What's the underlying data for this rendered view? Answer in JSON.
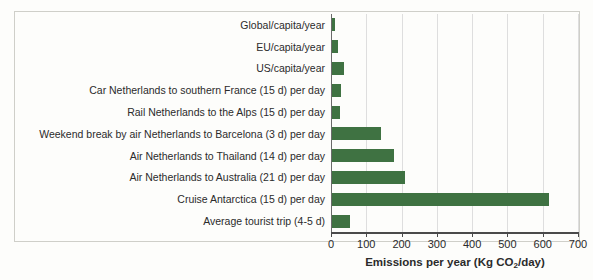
{
  "chart_data": {
    "type": "bar",
    "orientation": "horizontal",
    "title": "",
    "xlabel": "Emissions per year (Kg CO2/day)",
    "xlabel_prefix": "Emissions per year (Kg CO",
    "xlabel_subscript": "2",
    "xlabel_suffix": "/day)",
    "ylabel": "",
    "xlim": [
      0,
      700
    ],
    "xticks": [
      0,
      100,
      200,
      300,
      400,
      500,
      600,
      700
    ],
    "xticklabels": [
      "0",
      "100",
      "200",
      "300",
      "400",
      "500",
      "600",
      "700"
    ],
    "grid": "vertical",
    "legend": "none",
    "bar_color": "#3f7242",
    "categories": [
      "Global/capita/year",
      "EU/capita/year",
      "US/capita/year",
      "Car Netherlands to southern France (15 d) per day",
      "Rail Netherlands to the Alps (15 d) per day",
      "Weekend break by air Netherlands to Barcelona (3 d) per day",
      "Air Netherlands to Thailand (14 d) per day",
      "Air Netherlands to Australia (21 d) per day",
      "Cruise Antarctica (15 d) per day",
      "Average tourist trip (4-5 d)"
    ],
    "values": [
      8,
      17,
      34,
      26,
      23,
      139,
      176,
      207,
      615,
      51
    ]
  }
}
